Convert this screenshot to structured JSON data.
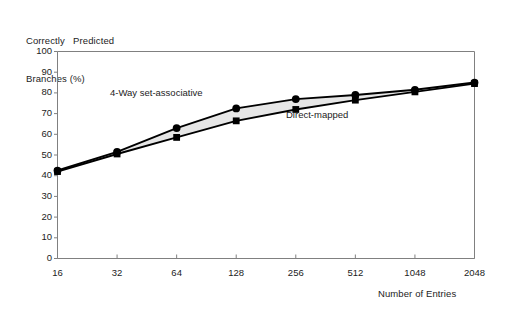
{
  "chart_data": {
    "type": "line",
    "title": "",
    "ylabel_line1": "Correctly   Predicted",
    "ylabel_line2": "Branches (%)",
    "xlabel": "Number of Entries",
    "categories": [
      "16",
      "32",
      "64",
      "128",
      "256",
      "512",
      "1048",
      "2048"
    ],
    "x_tick_labels": [
      "16",
      "32",
      "64",
      "128",
      "256",
      "512",
      "1048",
      "2048"
    ],
    "y_tick_labels": [
      "0",
      "10",
      "20",
      "30",
      "40",
      "50",
      "60",
      "70",
      "80",
      "90",
      "100"
    ],
    "y_ticks": [
      0,
      10,
      20,
      30,
      40,
      50,
      60,
      70,
      80,
      90,
      100
    ],
    "ylim": [
      0,
      100
    ],
    "grid": false,
    "legend_position": "inline-annotation",
    "series": [
      {
        "name": "4-Way set-associative",
        "marker": "circle",
        "values": [
          42.5,
          51.5,
          63.0,
          72.5,
          77.0,
          79.0,
          81.5,
          85.0
        ]
      },
      {
        "name": "Direct-mapped",
        "marker": "square",
        "values": [
          42.0,
          50.5,
          58.5,
          66.5,
          72.0,
          76.5,
          80.5,
          84.5
        ]
      }
    ],
    "annotations": [
      {
        "text": "4-Way set-associative",
        "x_px": 110,
        "y_px": 96
      },
      {
        "text": "Direct-mapped",
        "x_px": 286,
        "y_px": 118
      }
    ],
    "band_fill_color": "#e6e6e6",
    "line_color": "#000000",
    "axis_color": "#808080",
    "marker_color": "#000000"
  }
}
